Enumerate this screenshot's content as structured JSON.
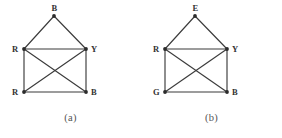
{
  "figure": {
    "panels": [
      {
        "id": "a",
        "caption": "(a)",
        "vertices": [
          {
            "name": "top",
            "label": "B",
            "x": 54,
            "y": 16,
            "label_dx": -2.5,
            "label_dy": -12
          },
          {
            "name": "middle-left",
            "label": "R",
            "x": 24,
            "y": 49,
            "label_dx": -12,
            "label_dy": -4
          },
          {
            "name": "middle-right",
            "label": "Y",
            "x": 86,
            "y": 49,
            "label_dx": 5,
            "label_dy": -4
          },
          {
            "name": "bottom-left",
            "label": "R",
            "x": 24,
            "y": 92,
            "label_dx": -12,
            "label_dy": -4
          },
          {
            "name": "bottom-right",
            "label": "B",
            "x": 86,
            "y": 92,
            "label_dx": 5,
            "label_dy": -4
          }
        ],
        "edges": [
          [
            "top",
            "middle-left"
          ],
          [
            "top",
            "middle-right"
          ],
          [
            "middle-left",
            "middle-right"
          ],
          [
            "middle-left",
            "bottom-left"
          ],
          [
            "middle-right",
            "bottom-right"
          ],
          [
            "bottom-left",
            "bottom-right"
          ],
          [
            "middle-left",
            "bottom-right"
          ],
          [
            "middle-right",
            "bottom-left"
          ]
        ]
      },
      {
        "id": "b",
        "caption": "(b)",
        "vertices": [
          {
            "name": "top",
            "label": "E",
            "x": 54,
            "y": 16,
            "label_dx": -2.5,
            "label_dy": -12
          },
          {
            "name": "middle-left",
            "label": "R",
            "x": 24,
            "y": 49,
            "label_dx": -12,
            "label_dy": -4
          },
          {
            "name": "middle-right",
            "label": "Y",
            "x": 86,
            "y": 49,
            "label_dx": 5,
            "label_dy": -4
          },
          {
            "name": "bottom-left",
            "label": "G",
            "x": 24,
            "y": 92,
            "label_dx": -12,
            "label_dy": -4
          },
          {
            "name": "bottom-right",
            "label": "B",
            "x": 86,
            "y": 92,
            "label_dx": 5,
            "label_dy": -4
          }
        ],
        "edges": [
          [
            "top",
            "middle-left"
          ],
          [
            "top",
            "middle-right"
          ],
          [
            "middle-left",
            "middle-right"
          ],
          [
            "middle-left",
            "bottom-left"
          ],
          [
            "middle-right",
            "bottom-right"
          ],
          [
            "bottom-left",
            "bottom-right"
          ],
          [
            "middle-left",
            "bottom-right"
          ],
          [
            "middle-right",
            "bottom-left"
          ]
        ]
      }
    ],
    "colors": {
      "edge": "#3b3b3b",
      "vertex": "#2b2b2b",
      "label": "#333333",
      "caption": "#555555",
      "background": "#ffffff"
    }
  }
}
